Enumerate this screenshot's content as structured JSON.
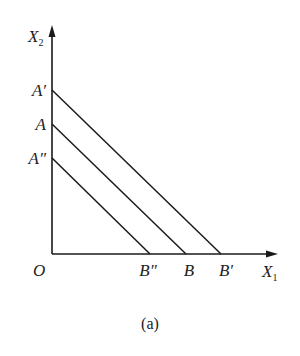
{
  "diagram": {
    "type": "budget-lines",
    "caption": "(a)",
    "axes": {
      "y_label": "X",
      "y_label_sub": "2",
      "x_label": "X",
      "x_label_sub": "1",
      "origin_label": "O"
    },
    "lines": [
      {
        "id": "A-prime-B-prime",
        "start_label": "A′",
        "end_label": "B′",
        "start_y": 90,
        "end_x": 221
      },
      {
        "id": "A-B",
        "start_label": "A",
        "end_label": "B",
        "start_y": 124,
        "end_x": 186
      },
      {
        "id": "A-double-prime-B-double-prime",
        "start_label": "A″",
        "end_label": "B″",
        "start_y": 158,
        "end_x": 150
      }
    ],
    "colors": {
      "stroke": "#1a1a1a",
      "background": "#ffffff"
    }
  }
}
